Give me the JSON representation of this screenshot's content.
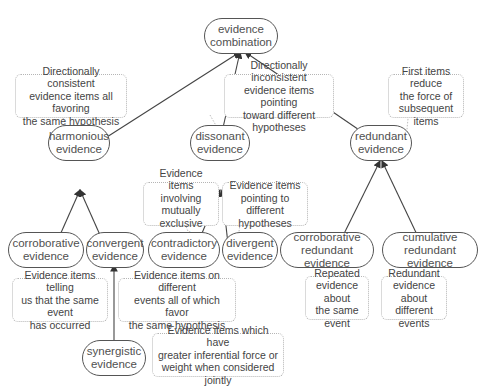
{
  "nodes": {
    "evidence_combination": "evidence\ncombination",
    "harmonious": "harmonious\nevidence",
    "dissonant": "dissonant\nevidence",
    "redundant": "redundant\nevidence",
    "corroborative": "corroborative\nevidence",
    "convergent": "convergent\nevidence",
    "contradictory": "contradictory\nevidence",
    "divergent": "divergent\nevidence",
    "corroborative_redundant": "corroborative\nredundant evidence",
    "cumulative_redundant": "cumulative\nredundant evidence",
    "synergistic": "synergistic\nevidence"
  },
  "notes": {
    "harmonious": "Directionally consistent\nevidence items all favoring\nthe same hypothesis",
    "dissonant": "Directionally inconsistent\nevidence items pointing\ntoward different hypotheses",
    "redundant": "First items reduce\nthe force of\nsubsequent items",
    "contradictory": "Evidence items\ninvolving mutually\nexclusive events",
    "divergent": "Evidence items\npointing to different\nhypotheses",
    "corroborative": "Evidence items telling\nus that the same event\nhas occurred",
    "convergent": "Evidence items on different\nevents all of which favor\nthe same hypothesis",
    "corroborative_redundant": "Repeated\nevidence about\nthe same event",
    "cumulative_redundant": "Redundant\nevidence about\ndifferent events",
    "synergistic": "Evidence items which have\ngreater inferential force or\nweight when considered jointly"
  }
}
